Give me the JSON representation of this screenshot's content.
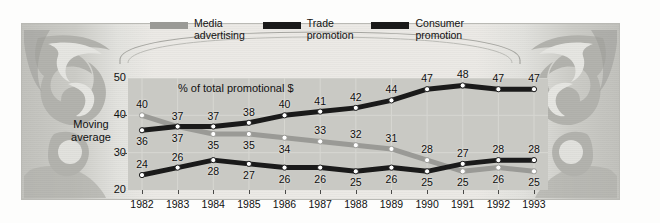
{
  "figure": {
    "ornament_label": "5",
    "banner_text": ""
  },
  "legend": {
    "items": [
      {
        "label": "Media\nadvertising",
        "color": "#9a9a96",
        "name": "media-advertising"
      },
      {
        "label": "Trade\npromotion",
        "color": "#1a1a1a",
        "name": "trade-promotion"
      },
      {
        "label": "Consumer\npromotion",
        "color": "#1a1a1a",
        "name": "consumer-promotion"
      }
    ]
  },
  "axis": {
    "y_title": "Moving\naverage",
    "subtitle": "% of total promotional $"
  },
  "chart_data": {
    "type": "line",
    "title": "",
    "subtitle": "% of total promotional $",
    "xlabel": "",
    "ylabel": "Moving average",
    "ylim": [
      20,
      50
    ],
    "yticks": [
      20,
      30,
      40,
      50
    ],
    "grid": true,
    "legend_position": "top",
    "categories": [
      "1982",
      "1983",
      "1984",
      "1985",
      "1986",
      "1987",
      "1988",
      "1989",
      "1990",
      "1991",
      "1992",
      "1993"
    ],
    "series": [
      {
        "name": "Media advertising",
        "color": "#9a9a96",
        "values": [
          40,
          37,
          35,
          35,
          34,
          33,
          32,
          31,
          28,
          25,
          26,
          25
        ],
        "label_offsets": [
          "above",
          "above",
          "below",
          "below",
          "below",
          "above",
          "above",
          "above",
          "above",
          "below",
          "below",
          "below"
        ]
      },
      {
        "name": "Trade promotion",
        "color": "#1a1a1a",
        "values": [
          36,
          37,
          37,
          38,
          40,
          41,
          42,
          44,
          47,
          48,
          47,
          47
        ],
        "label_offsets": [
          "below",
          "below",
          "above",
          "above",
          "above",
          "above",
          "above",
          "above",
          "above",
          "above",
          "above",
          "above"
        ]
      },
      {
        "name": "Consumer promotion",
        "color": "#1a1a1a",
        "values": [
          24,
          26,
          28,
          27,
          26,
          26,
          25,
          26,
          25,
          27,
          28,
          28
        ],
        "label_offsets": [
          "above",
          "above",
          "below",
          "below",
          "below",
          "below",
          "below",
          "below",
          "below",
          "above",
          "above",
          "above"
        ]
      }
    ]
  }
}
